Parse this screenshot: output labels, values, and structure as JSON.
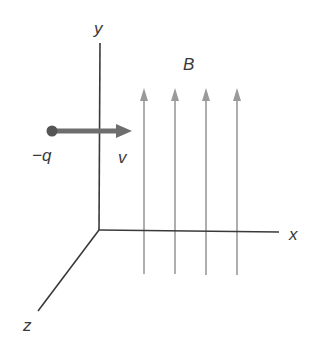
{
  "diagram": {
    "axes": {
      "y_label": "y",
      "x_label": "x",
      "z_label": "z",
      "color": "#3a3a3a"
    },
    "charge": {
      "label": "−q",
      "color": "#555555"
    },
    "velocity": {
      "label": "v",
      "color": "#6e6e6e"
    },
    "field": {
      "label": "B",
      "line_count": 4,
      "color": "#9a9a9a"
    }
  }
}
